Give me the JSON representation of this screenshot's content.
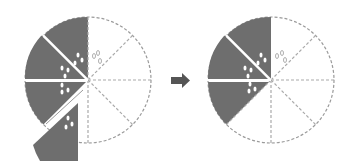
{
  "diagram": {
    "total_slices": 8,
    "left_pie": {
      "shaded_slices": 4,
      "removed_slice_index": 3,
      "label": ""
    },
    "right_pie": {
      "shaded_slices": 3,
      "label": ""
    },
    "arrow": {
      "direction": "right"
    },
    "colors": {
      "shaded": "#6e6e6e",
      "outline": "#9a9a9a",
      "seed": "#ffffff",
      "arrow": "#555555"
    }
  }
}
